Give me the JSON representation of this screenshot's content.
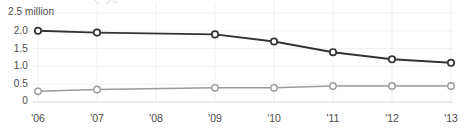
{
  "chart_data": {
    "type": "line",
    "x": [
      "'06",
      "'07",
      "'08",
      "'09",
      "'10",
      "'11",
      "'12",
      "'13"
    ],
    "series": [
      {
        "id": "upper-line",
        "color": "#333333",
        "values": [
          2.0,
          1.95,
          null,
          1.9,
          1.7,
          1.4,
          1.2,
          1.1
        ]
      },
      {
        "id": "lower-line",
        "color": "#9a9a9a",
        "values": [
          0.3,
          0.35,
          null,
          0.4,
          0.4,
          0.45,
          0.45,
          0.45
        ]
      }
    ],
    "missing_x": [
      "'08"
    ],
    "y_ticks": [
      {
        "label": "2.5 million",
        "value": 2.5
      },
      {
        "label": "2.0",
        "value": 2.0
      },
      {
        "label": "1.5",
        "value": 1.5
      },
      {
        "label": "1.0",
        "value": 1.0
      },
      {
        "label": "0.5",
        "value": 0.5
      },
      {
        "label": "0",
        "value": 0
      }
    ],
    "unit": "million",
    "ylim": [
      0,
      2.5
    ],
    "grid": true,
    "legend": "none",
    "marker": "open-circle",
    "colors": {
      "gridline": "#f1efee",
      "baseline": "#d8d8d8",
      "tick_text": "#4b4b4b",
      "marker_fill": "#ffffff"
    }
  }
}
